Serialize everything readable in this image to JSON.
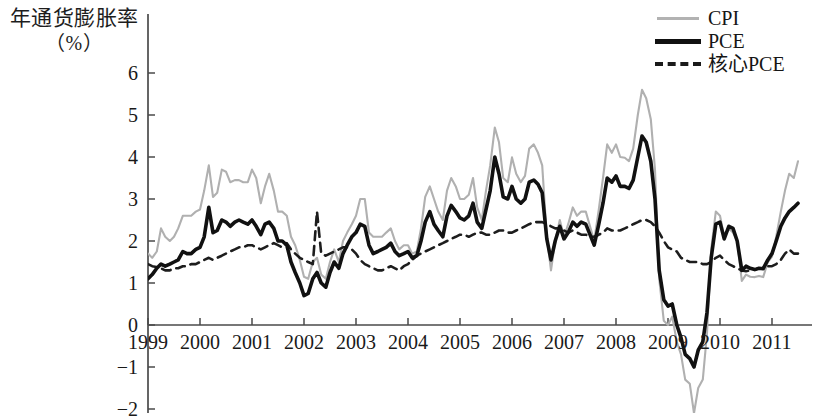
{
  "chart_data": {
    "type": "line",
    "title": "",
    "ylabel_line1": "年通货膨胀率",
    "ylabel_line2": "（%）",
    "xlabel": "",
    "ylim": [
      -2.2,
      6.6
    ],
    "xlim": [
      1999.0,
      2011.55
    ],
    "grid": false,
    "legend_position": "top-right",
    "yticks": [
      6,
      5,
      4,
      3,
      2,
      1,
      0,
      -1,
      -2
    ],
    "ytick_labels": [
      "6",
      "5",
      "4",
      "3",
      "2",
      "1",
      "0",
      "−1",
      "−2"
    ],
    "xticks": [
      1999,
      2000,
      2001,
      2002,
      2003,
      2004,
      2005,
      2006,
      2007,
      2008,
      2009,
      2010,
      2011
    ],
    "xtick_labels": [
      "1999",
      "2000",
      "2001",
      "2002",
      "2003",
      "2004",
      "2005",
      "2006",
      "2007",
      "2008",
      "2009",
      "2010",
      "2011"
    ],
    "colors": {
      "cpi": "#b0b0b0",
      "pce": "#111111",
      "core_pce": "#1d1d1d",
      "axis": "#4a4a4a"
    },
    "series": [
      {
        "name": "CPI",
        "style": "solid-thin-gray",
        "x": [
          1999.0,
          1999.08,
          1999.17,
          1999.25,
          1999.33,
          1999.42,
          1999.5,
          1999.58,
          1999.67,
          1999.75,
          1999.83,
          1999.92,
          2000.0,
          2000.08,
          2000.17,
          2000.25,
          2000.33,
          2000.42,
          2000.5,
          2000.58,
          2000.67,
          2000.75,
          2000.83,
          2000.92,
          2001.0,
          2001.08,
          2001.17,
          2001.25,
          2001.33,
          2001.42,
          2001.5,
          2001.58,
          2001.67,
          2001.75,
          2001.83,
          2001.92,
          2002.0,
          2002.08,
          2002.17,
          2002.25,
          2002.33,
          2002.42,
          2002.5,
          2002.58,
          2002.67,
          2002.75,
          2002.83,
          2002.92,
          2003.0,
          2003.08,
          2003.17,
          2003.25,
          2003.33,
          2003.42,
          2003.5,
          2003.58,
          2003.67,
          2003.75,
          2003.83,
          2003.92,
          2004.0,
          2004.08,
          2004.17,
          2004.25,
          2004.33,
          2004.42,
          2004.5,
          2004.58,
          2004.67,
          2004.75,
          2004.83,
          2004.92,
          2005.0,
          2005.08,
          2005.17,
          2005.25,
          2005.33,
          2005.42,
          2005.5,
          2005.58,
          2005.67,
          2005.75,
          2005.83,
          2005.92,
          2006.0,
          2006.08,
          2006.17,
          2006.25,
          2006.33,
          2006.42,
          2006.5,
          2006.58,
          2006.67,
          2006.75,
          2006.83,
          2006.92,
          2007.0,
          2007.08,
          2007.17,
          2007.25,
          2007.33,
          2007.42,
          2007.5,
          2007.58,
          2007.67,
          2007.75,
          2007.83,
          2007.92,
          2008.0,
          2008.08,
          2008.17,
          2008.25,
          2008.33,
          2008.42,
          2008.5,
          2008.58,
          2008.67,
          2008.75,
          2008.83,
          2008.92,
          2009.0,
          2009.08,
          2009.17,
          2009.25,
          2009.33,
          2009.42,
          2009.5,
          2009.58,
          2009.67,
          2009.75,
          2009.83,
          2009.92,
          2010.0,
          2010.08,
          2010.17,
          2010.25,
          2010.33,
          2010.42,
          2010.5,
          2010.58,
          2010.67,
          2010.75,
          2010.83,
          2010.92,
          2011.0,
          2011.08,
          2011.17,
          2011.25,
          2011.33,
          2011.42,
          2011.5
        ],
        "values": [
          1.7,
          1.6,
          1.75,
          2.3,
          2.1,
          2.0,
          2.1,
          2.3,
          2.6,
          2.6,
          2.6,
          2.7,
          2.75,
          3.2,
          3.8,
          3.05,
          3.15,
          3.7,
          3.65,
          3.4,
          3.45,
          3.45,
          3.4,
          3.4,
          3.7,
          3.5,
          2.9,
          3.3,
          3.6,
          3.2,
          2.7,
          2.7,
          2.6,
          2.1,
          1.9,
          1.55,
          1.15,
          1.1,
          1.5,
          1.6,
          1.2,
          1.1,
          1.5,
          1.8,
          1.5,
          2.0,
          2.2,
          2.4,
          2.6,
          3.0,
          3.0,
          2.2,
          2.1,
          2.1,
          2.1,
          2.2,
          2.3,
          2.0,
          1.8,
          1.9,
          1.9,
          1.7,
          1.75,
          2.3,
          3.05,
          3.3,
          3.0,
          2.7,
          2.5,
          3.2,
          3.5,
          3.3,
          3.0,
          3.0,
          3.1,
          3.5,
          2.8,
          2.5,
          3.2,
          3.8,
          4.7,
          4.35,
          3.5,
          3.4,
          3.99,
          3.6,
          3.4,
          3.55,
          4.2,
          4.3,
          4.1,
          3.8,
          2.1,
          1.3,
          2.0,
          2.5,
          2.1,
          2.4,
          2.8,
          2.6,
          2.7,
          2.7,
          2.35,
          2.0,
          2.75,
          3.5,
          4.3,
          4.1,
          4.3,
          4.0,
          3.98,
          3.9,
          4.2,
          5.0,
          5.6,
          5.4,
          4.9,
          3.7,
          1.1,
          0.1,
          0.0,
          0.2,
          -0.4,
          -0.7,
          -1.3,
          -1.4,
          -2.1,
          -1.5,
          -1.3,
          -0.2,
          1.8,
          2.7,
          2.6,
          2.1,
          2.3,
          2.2,
          2.0,
          1.05,
          1.2,
          1.15,
          1.14,
          1.17,
          1.14,
          1.5,
          1.63,
          2.1,
          2.7,
          3.2,
          3.6,
          3.5,
          3.9
        ],
        "notes": "CPI dips below the plotted −2 floor mid-2009; clipped at chart bottom"
      },
      {
        "name": "PCE",
        "style": "solid-thick-black",
        "x": [
          1999.0,
          1999.08,
          1999.17,
          1999.25,
          1999.33,
          1999.42,
          1999.5,
          1999.58,
          1999.67,
          1999.75,
          1999.83,
          1999.92,
          2000.0,
          2000.08,
          2000.17,
          2000.25,
          2000.33,
          2000.42,
          2000.5,
          2000.58,
          2000.67,
          2000.75,
          2000.83,
          2000.92,
          2001.0,
          2001.08,
          2001.17,
          2001.25,
          2001.33,
          2001.42,
          2001.5,
          2001.58,
          2001.67,
          2001.75,
          2001.83,
          2001.92,
          2002.0,
          2002.08,
          2002.17,
          2002.25,
          2002.33,
          2002.42,
          2002.5,
          2002.58,
          2002.67,
          2002.75,
          2002.83,
          2002.92,
          2003.0,
          2003.08,
          2003.17,
          2003.25,
          2003.33,
          2003.42,
          2003.5,
          2003.58,
          2003.67,
          2003.75,
          2003.83,
          2003.92,
          2004.0,
          2004.08,
          2004.17,
          2004.25,
          2004.33,
          2004.42,
          2004.5,
          2004.58,
          2004.67,
          2004.75,
          2004.83,
          2004.92,
          2005.0,
          2005.08,
          2005.17,
          2005.25,
          2005.33,
          2005.42,
          2005.5,
          2005.58,
          2005.67,
          2005.75,
          2005.83,
          2005.92,
          2006.0,
          2006.08,
          2006.17,
          2006.25,
          2006.33,
          2006.42,
          2006.5,
          2006.58,
          2006.67,
          2006.75,
          2006.83,
          2006.92,
          2007.0,
          2007.08,
          2007.17,
          2007.25,
          2007.33,
          2007.42,
          2007.5,
          2007.58,
          2007.67,
          2007.75,
          2007.83,
          2007.92,
          2008.0,
          2008.08,
          2008.17,
          2008.25,
          2008.33,
          2008.42,
          2008.5,
          2008.58,
          2008.67,
          2008.75,
          2008.83,
          2008.92,
          2009.0,
          2009.08,
          2009.17,
          2009.25,
          2009.33,
          2009.42,
          2009.5,
          2009.58,
          2009.67,
          2009.75,
          2009.83,
          2009.92,
          2010.0,
          2010.08,
          2010.17,
          2010.25,
          2010.33,
          2010.42,
          2010.5,
          2010.58,
          2010.67,
          2010.75,
          2010.83,
          2010.92,
          2011.0,
          2011.08,
          2011.17,
          2011.25,
          2011.33,
          2011.42,
          2011.5
        ],
        "values": [
          1.1,
          1.2,
          1.35,
          1.45,
          1.4,
          1.45,
          1.5,
          1.55,
          1.75,
          1.7,
          1.7,
          1.8,
          1.85,
          2.1,
          2.8,
          2.2,
          2.25,
          2.5,
          2.45,
          2.35,
          2.45,
          2.5,
          2.45,
          2.4,
          2.5,
          2.35,
          2.15,
          2.4,
          2.45,
          2.3,
          2.0,
          2.0,
          1.9,
          1.5,
          1.25,
          1.0,
          0.7,
          0.75,
          1.1,
          1.25,
          1.0,
          0.9,
          1.25,
          1.5,
          1.35,
          1.7,
          1.9,
          2.1,
          2.2,
          2.4,
          2.35,
          1.9,
          1.7,
          1.75,
          1.8,
          1.85,
          1.95,
          1.75,
          1.65,
          1.7,
          1.75,
          1.6,
          1.65,
          2.0,
          2.45,
          2.7,
          2.4,
          2.25,
          2.1,
          2.6,
          2.85,
          2.7,
          2.55,
          2.5,
          2.6,
          2.9,
          2.45,
          2.3,
          2.75,
          3.2,
          4.0,
          3.6,
          3.05,
          3.0,
          3.3,
          3.0,
          2.9,
          3.0,
          3.4,
          3.45,
          3.35,
          3.15,
          2.05,
          1.55,
          2.0,
          2.35,
          2.05,
          2.2,
          2.45,
          2.35,
          2.45,
          2.4,
          2.15,
          1.9,
          2.4,
          2.9,
          3.5,
          3.4,
          3.55,
          3.3,
          3.3,
          3.25,
          3.45,
          4.0,
          4.5,
          4.35,
          3.9,
          3.0,
          1.3,
          0.6,
          0.45,
          0.5,
          0.0,
          -0.3,
          -0.7,
          -0.8,
          -1.0,
          -0.6,
          -0.4,
          0.3,
          1.6,
          2.4,
          2.45,
          2.05,
          2.35,
          2.3,
          2.0,
          1.3,
          1.4,
          1.35,
          1.32,
          1.35,
          1.34,
          1.55,
          1.7,
          2.0,
          2.35,
          2.55,
          2.7,
          2.8,
          2.9
        ]
      },
      {
        "name": "核心PCE",
        "style": "dashed-black",
        "x": [
          1999.0,
          1999.08,
          1999.17,
          1999.25,
          1999.33,
          1999.42,
          1999.5,
          1999.58,
          1999.67,
          1999.75,
          1999.83,
          1999.92,
          2000.0,
          2000.08,
          2000.17,
          2000.25,
          2000.33,
          2000.42,
          2000.5,
          2000.58,
          2000.67,
          2000.75,
          2000.83,
          2000.92,
          2001.0,
          2001.08,
          2001.17,
          2001.25,
          2001.33,
          2001.42,
          2001.5,
          2001.58,
          2001.67,
          2001.75,
          2001.83,
          2001.92,
          2002.0,
          2002.08,
          2002.17,
          2002.25,
          2002.33,
          2002.42,
          2002.5,
          2002.58,
          2002.67,
          2002.75,
          2002.83,
          2002.92,
          2003.0,
          2003.08,
          2003.17,
          2003.25,
          2003.33,
          2003.42,
          2003.5,
          2003.58,
          2003.67,
          2003.75,
          2003.83,
          2003.92,
          2004.0,
          2004.08,
          2004.17,
          2004.25,
          2004.33,
          2004.42,
          2004.5,
          2004.58,
          2004.67,
          2004.75,
          2004.83,
          2004.92,
          2005.0,
          2005.08,
          2005.17,
          2005.25,
          2005.33,
          2005.42,
          2005.5,
          2005.58,
          2005.67,
          2005.75,
          2005.83,
          2005.92,
          2006.0,
          2006.08,
          2006.17,
          2006.25,
          2006.33,
          2006.42,
          2006.5,
          2006.58,
          2006.67,
          2006.75,
          2006.83,
          2006.92,
          2007.0,
          2007.08,
          2007.17,
          2007.25,
          2007.33,
          2007.42,
          2007.5,
          2007.58,
          2007.67,
          2007.75,
          2007.83,
          2007.92,
          2008.0,
          2008.08,
          2008.17,
          2008.25,
          2008.33,
          2008.42,
          2008.5,
          2008.58,
          2008.67,
          2008.75,
          2008.83,
          2008.92,
          2009.0,
          2009.08,
          2009.17,
          2009.25,
          2009.33,
          2009.42,
          2009.5,
          2009.58,
          2009.67,
          2009.75,
          2009.83,
          2009.92,
          2010.0,
          2010.08,
          2010.17,
          2010.25,
          2010.33,
          2010.42,
          2010.5,
          2010.58,
          2010.67,
          2010.75,
          2010.83,
          2010.92,
          2011.0,
          2011.08,
          2011.17,
          2011.25,
          2011.33,
          2011.42,
          2011.5
        ],
        "values": [
          1.45,
          1.4,
          1.38,
          1.35,
          1.3,
          1.3,
          1.35,
          1.35,
          1.4,
          1.4,
          1.45,
          1.45,
          1.5,
          1.55,
          1.6,
          1.55,
          1.6,
          1.65,
          1.7,
          1.75,
          1.8,
          1.85,
          1.85,
          1.9,
          1.9,
          1.85,
          1.8,
          1.85,
          1.9,
          1.95,
          1.9,
          1.85,
          1.95,
          1.8,
          1.7,
          1.6,
          1.55,
          1.5,
          1.45,
          2.7,
          1.7,
          1.65,
          1.7,
          1.75,
          1.8,
          1.85,
          1.85,
          1.8,
          1.7,
          1.55,
          1.45,
          1.4,
          1.35,
          1.3,
          1.3,
          1.35,
          1.4,
          1.35,
          1.3,
          1.4,
          1.45,
          1.55,
          1.65,
          1.7,
          1.75,
          1.8,
          1.85,
          1.9,
          1.95,
          2.0,
          2.05,
          2.1,
          2.15,
          2.15,
          2.1,
          2.15,
          2.2,
          2.2,
          2.15,
          2.15,
          2.2,
          2.25,
          2.25,
          2.2,
          2.2,
          2.25,
          2.3,
          2.35,
          2.4,
          2.45,
          2.45,
          2.45,
          2.4,
          2.35,
          2.3,
          2.3,
          2.25,
          2.2,
          2.25,
          2.2,
          2.15,
          2.15,
          2.1,
          2.1,
          2.15,
          2.2,
          2.3,
          2.25,
          2.25,
          2.25,
          2.3,
          2.35,
          2.4,
          2.45,
          2.5,
          2.5,
          2.45,
          2.35,
          2.2,
          2.0,
          1.85,
          1.8,
          1.75,
          1.6,
          1.55,
          1.5,
          1.5,
          1.5,
          1.45,
          1.45,
          1.5,
          1.6,
          1.65,
          1.55,
          1.45,
          1.4,
          1.35,
          1.3,
          1.28,
          1.3,
          1.32,
          1.35,
          1.35,
          1.4,
          1.4,
          1.45,
          1.55,
          1.7,
          1.8,
          1.7,
          1.7
        ]
      }
    ]
  },
  "legend": {
    "items": [
      {
        "label": "CPI",
        "key": "cpi"
      },
      {
        "label": "PCE",
        "key": "pce"
      },
      {
        "label": "核心PCE",
        "key": "core"
      }
    ]
  }
}
